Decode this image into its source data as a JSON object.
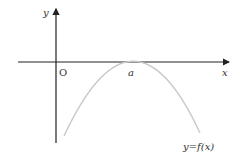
{
  "diagram": {
    "type": "function-graph",
    "labels": {
      "y_axis": "y",
      "x_axis": "x",
      "origin": "O",
      "vertex": "a",
      "function": "y=f(x)"
    },
    "colors": {
      "axes": "#222222",
      "curve": "#c8c8c8",
      "text": "#333333"
    }
  }
}
